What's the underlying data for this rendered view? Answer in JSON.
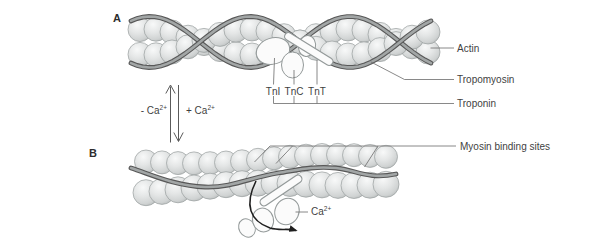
{
  "panel_a": {
    "label": "A"
  },
  "panel_b": {
    "label": "B"
  },
  "callouts": {
    "actin": "Actin",
    "tropomyosin": "Tropomyosin",
    "troponin": "Troponin",
    "myosin_binding_sites": "Myosin binding sites"
  },
  "troponin_subunits": {
    "tni": "TnI",
    "tnc": "TnC",
    "tnt": "TnT"
  },
  "calcium": {
    "remove": "- Ca",
    "add": "+ Ca",
    "ion": "Ca",
    "superscript": "2+"
  },
  "colors": {
    "background": "#ffffff",
    "sphere_fill": "#e2e4e4",
    "sphere_outline": "#989e9e",
    "tropomyosin_core": "#a2a6a6",
    "tropomyosin_outline": "#585858",
    "troponin_fill": "#fbfbfb",
    "troponin_outline": "#949a9a",
    "leader_line": "#6b6b6b",
    "text": "#3f3f3f",
    "arrow": "#1f1f1f"
  }
}
